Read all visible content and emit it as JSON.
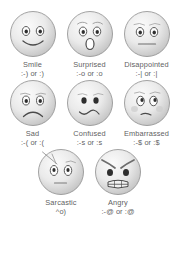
{
  "page": {
    "background_color": "#ffffff",
    "text_color": "#5f5f63",
    "face_fill_light": "#f4f4f4",
    "face_fill_mid": "#dedede",
    "face_fill_shadow": "#bdbdbd",
    "face_stroke": "#8d8d8d",
    "feature_color": "#4a4a4a"
  },
  "emoticons": [
    {
      "name": "Smile",
      "code": ":-) or :)",
      "icon": "smile-face-icon"
    },
    {
      "name": "Surprised",
      "code": ":-o or :o",
      "icon": "surprised-face-icon"
    },
    {
      "name": "Disappointed",
      "code": ":-| or :|",
      "icon": "disappointed-face-icon"
    },
    {
      "name": "Sad",
      "code": ":-( or :(",
      "icon": "sad-face-icon"
    },
    {
      "name": "Confused",
      "code": ":-s or :s",
      "icon": "confused-face-icon"
    },
    {
      "name": "Embarrassed",
      "code": ":-$ or :$",
      "icon": "embarrassed-face-icon"
    },
    {
      "name": "Sarcastic",
      "code": "^o)",
      "icon": "sarcastic-face-icon"
    },
    {
      "name": "Angry",
      "code": ":-@ or :@",
      "icon": "angry-face-icon"
    }
  ]
}
